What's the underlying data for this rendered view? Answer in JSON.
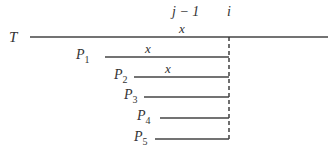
{
  "diagram": {
    "text_label": "T",
    "column_labels": {
      "prev": "j − 1",
      "current": "i"
    },
    "text_mark": "x",
    "patterns": [
      {
        "name": "P",
        "sub": "1",
        "mark": "x"
      },
      {
        "name": "P",
        "sub": "2",
        "mark": "x"
      },
      {
        "name": "P",
        "sub": "3",
        "mark": ""
      },
      {
        "name": "P",
        "sub": "4",
        "mark": ""
      },
      {
        "name": "P",
        "sub": "5",
        "mark": ""
      }
    ]
  }
}
